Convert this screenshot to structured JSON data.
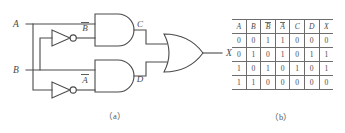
{
  "figure": {
    "caption_a": "（a）",
    "caption_b": "（b）",
    "stroke_color": "#4a4a4a",
    "background": "#ffffff"
  },
  "circuit": {
    "title": "XOR logic circuit",
    "inputs": [
      {
        "name": "A",
        "label": "A"
      },
      {
        "name": "B",
        "label": "B"
      }
    ],
    "internal_signals": [
      {
        "name": "B-bar",
        "label": "B",
        "overbar": true
      },
      {
        "name": "A-bar",
        "label": "A",
        "overbar": true
      },
      {
        "name": "C",
        "label": "C",
        "overbar": false
      },
      {
        "name": "D",
        "label": "D",
        "overbar": false
      }
    ],
    "output": {
      "name": "X",
      "label": "X"
    },
    "gates": [
      {
        "name": "inverter-top",
        "type": "NOT",
        "input": "B",
        "output": "B-bar"
      },
      {
        "name": "inverter-bottom",
        "type": "NOT",
        "input": "A",
        "output": "A-bar"
      },
      {
        "name": "and-gate-top",
        "type": "AND",
        "inputs": [
          "A",
          "B-bar"
        ],
        "output": "C"
      },
      {
        "name": "and-gate-bottom",
        "type": "AND",
        "inputs": [
          "B",
          "A-bar"
        ],
        "output": "D"
      },
      {
        "name": "or-gate",
        "type": "OR",
        "inputs": [
          "C",
          "D"
        ],
        "output": "X"
      }
    ]
  },
  "truth_table": {
    "headers": [
      {
        "label": "A",
        "overbar": false
      },
      {
        "label": "B",
        "overbar": false
      },
      {
        "label": "B",
        "overbar": true
      },
      {
        "label": "A",
        "overbar": true
      },
      {
        "label": "C",
        "overbar": false
      },
      {
        "label": "D",
        "overbar": false
      },
      {
        "label": "X",
        "overbar": false
      }
    ],
    "rows": [
      [
        "0",
        "0",
        "1",
        "1",
        "0",
        "0",
        "0"
      ],
      [
        "0",
        "1",
        "0",
        "1",
        "0",
        "1",
        "1"
      ],
      [
        "1",
        "0",
        "1",
        "0",
        "1",
        "0",
        "1"
      ],
      [
        "1",
        "1",
        "0",
        "0",
        "0",
        "0",
        "0"
      ]
    ]
  }
}
